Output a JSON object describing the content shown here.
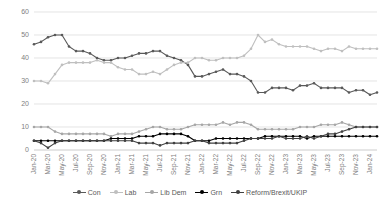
{
  "chart_data": {
    "type": "line",
    "title": "",
    "subtitle": "",
    "xlabel": "",
    "ylabel": "",
    "ylim": [
      0,
      60
    ],
    "yticks": [
      0,
      10,
      20,
      30,
      40,
      50,
      60
    ],
    "grid": true,
    "legend_position": "bottom",
    "x": [
      "Jan-20",
      "Feb-20",
      "Mar-20",
      "Apr-20",
      "May-20",
      "Jun-20",
      "Jul-20",
      "Aug-20",
      "Sep-20",
      "Oct-20",
      "Nov-20",
      "Dec-20",
      "Jan-21",
      "Feb-21",
      "Mar-21",
      "Apr-21",
      "May-21",
      "Jun-21",
      "Jul-21",
      "Aug-21",
      "Sep-21",
      "Oct-21",
      "Nov-21",
      "Dec-21",
      "Jan-22",
      "Feb-22",
      "Mar-22",
      "Apr-22",
      "May-22",
      "Jun-22",
      "Jul-22",
      "Aug-22",
      "Sep-22",
      "Oct-22",
      "Nov-22",
      "Dec-22",
      "Jan-23",
      "Feb-23",
      "Mar-23",
      "Apr-23",
      "May-23",
      "Jun-23",
      "Jul-23",
      "Aug-23",
      "Sep-23",
      "Oct-23",
      "Nov-23",
      "Dec-23",
      "Jan-24",
      "Feb-24"
    ],
    "xtick_labels": [
      "Jan-20",
      "Mar-20",
      "May-20",
      "Jul-20",
      "Sep-20",
      "Nov-20",
      "Jan-21",
      "Mar-21",
      "May-21",
      "Jul-21",
      "Sep-21",
      "Nov-21",
      "Jan-22",
      "Mar-22",
      "May-22",
      "Jul-22",
      "Sep-22",
      "Nov-22",
      "Jan-23",
      "Mar-23",
      "May-23",
      "Jul-23",
      "Sep-23",
      "Nov-23",
      "Jan-24"
    ],
    "series": [
      {
        "name": "Con",
        "color": "#595959",
        "values": [
          46,
          47,
          49,
          50,
          50,
          45,
          43,
          43,
          42,
          40,
          39,
          39,
          40,
          40,
          41,
          42,
          42,
          43,
          43,
          41,
          40,
          39,
          37,
          32,
          32,
          33,
          34,
          35,
          33,
          33,
          32,
          30,
          25,
          25,
          27,
          27,
          27,
          26,
          28,
          28,
          29,
          27,
          27,
          27,
          27,
          25,
          26,
          26,
          24,
          25
        ]
      },
      {
        "name": "Lab",
        "color": "#bfbfbf",
        "values": [
          30,
          30,
          29,
          33,
          37,
          38,
          38,
          38,
          38,
          39,
          38,
          38,
          36,
          35,
          35,
          33,
          33,
          34,
          33,
          35,
          37,
          38,
          38,
          40,
          40,
          39,
          39,
          40,
          40,
          40,
          41,
          44,
          50,
          47,
          48,
          46,
          45,
          45,
          45,
          45,
          44,
          43,
          44,
          44,
          43,
          45,
          44,
          44,
          44,
          44
        ]
      },
      {
        "name": "Lib Dem",
        "color": "#a6a6a6",
        "values": [
          10,
          10,
          10,
          8,
          7,
          7,
          7,
          7,
          7,
          7,
          7,
          6,
          7,
          7,
          7,
          8,
          9,
          10,
          10,
          9,
          9,
          9,
          10,
          11,
          11,
          11,
          11,
          12,
          11,
          12,
          12,
          11,
          9,
          9,
          9,
          9,
          9,
          9,
          10,
          10,
          10,
          11,
          11,
          11,
          12,
          11,
          10,
          10,
          10,
          10
        ]
      },
      {
        "name": "Grn",
        "color": "#000000",
        "values": [
          4,
          4,
          4,
          4,
          4,
          4,
          4,
          4,
          4,
          4,
          4,
          5,
          5,
          5,
          5,
          6,
          6,
          6,
          7,
          7,
          7,
          7,
          6,
          4,
          4,
          4,
          5,
          5,
          5,
          5,
          5,
          5,
          5,
          6,
          6,
          6,
          6,
          6,
          6,
          5,
          6,
          6,
          6,
          6,
          6,
          6,
          6,
          6,
          6,
          6
        ]
      },
      {
        "name": "Reform/Brexit/UKIP",
        "color": "#404040",
        "values": [
          4,
          3,
          1,
          3,
          4,
          4,
          4,
          4,
          4,
          4,
          4,
          4,
          4,
          4,
          4,
          3,
          3,
          3,
          2,
          3,
          3,
          3,
          3,
          4,
          4,
          3,
          3,
          3,
          3,
          3,
          4,
          5,
          5,
          5,
          5,
          6,
          5,
          5,
          5,
          6,
          5,
          6,
          7,
          7,
          8,
          9,
          10,
          10,
          10,
          10
        ]
      }
    ]
  },
  "legend": {
    "items": [
      {
        "label": "Con"
      },
      {
        "label": "Lab"
      },
      {
        "label": "Lib Dem"
      },
      {
        "label": "Grn"
      },
      {
        "label": "Reform/Brexit/UKIP"
      }
    ]
  }
}
